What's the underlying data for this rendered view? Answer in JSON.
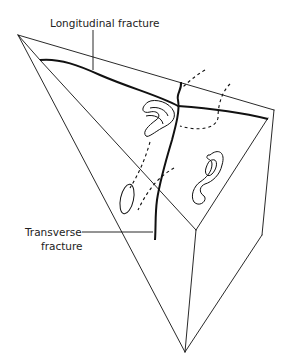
{
  "figure": {
    "labels": {
      "longitudinal": "Longitudinal fracture",
      "transverse_line1": "Transverse",
      "transverse_line2": "fracture"
    },
    "colors": {
      "stroke": "#111111",
      "background": "#ffffff",
      "text": "#222222"
    }
  }
}
